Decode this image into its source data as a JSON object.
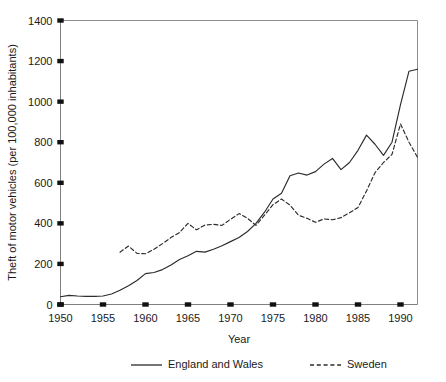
{
  "chart_data": {
    "type": "line",
    "title": "",
    "xlabel": "Year",
    "ylabel": "Theft of motor vehicles (per 100,000 inhabitants)",
    "xlim": [
      1950,
      1992
    ],
    "ylim": [
      0,
      1400
    ],
    "xticks": [
      1950,
      1955,
      1960,
      1965,
      1970,
      1975,
      1980,
      1985,
      1990
    ],
    "yticks": [
      0,
      200,
      400,
      600,
      800,
      1000,
      1200,
      1400
    ],
    "xtick_labels": [
      "1950",
      "1955",
      "1960",
      "1965",
      "1970",
      "1975",
      "1980",
      "1985",
      "1990"
    ],
    "ytick_labels": [
      "0",
      "200",
      "400",
      "600",
      "800",
      "1000",
      "1200",
      "1400"
    ],
    "grid": false,
    "legend_position": "bottom",
    "series": [
      {
        "name": "England and Wales",
        "style": "solid",
        "color": "#2b2b2b",
        "x": [
          1950,
          1951,
          1952,
          1953,
          1954,
          1955,
          1956,
          1957,
          1958,
          1959,
          1960,
          1961,
          1962,
          1963,
          1964,
          1965,
          1966,
          1967,
          1968,
          1969,
          1970,
          1971,
          1972,
          1973,
          1974,
          1975,
          1976,
          1977,
          1978,
          1979,
          1980,
          1981,
          1982,
          1983,
          1984,
          1985,
          1986,
          1987,
          1988,
          1989,
          1990,
          1991,
          1992
        ],
        "values": [
          38,
          45,
          42,
          40,
          40,
          42,
          52,
          70,
          92,
          118,
          152,
          158,
          172,
          195,
          222,
          240,
          262,
          258,
          272,
          290,
          310,
          330,
          360,
          400,
          455,
          520,
          548,
          635,
          648,
          638,
          655,
          692,
          720,
          665,
          700,
          760,
          835,
          790,
          735,
          800,
          985,
          1150,
          1160
        ]
      },
      {
        "name": "Sweden",
        "style": "dashed",
        "color": "#2b2b2b",
        "x": [
          1957,
          1958,
          1959,
          1960,
          1961,
          1962,
          1963,
          1964,
          1965,
          1966,
          1967,
          1968,
          1969,
          1970,
          1971,
          1972,
          1973,
          1974,
          1975,
          1976,
          1977,
          1978,
          1979,
          1980,
          1981,
          1982,
          1983,
          1984,
          1985,
          1986,
          1987,
          1988,
          1989,
          1990,
          1991,
          1992
        ],
        "values": [
          258,
          288,
          252,
          250,
          272,
          300,
          330,
          355,
          400,
          368,
          392,
          395,
          390,
          420,
          448,
          425,
          390,
          440,
          492,
          520,
          490,
          440,
          425,
          405,
          422,
          418,
          428,
          452,
          478,
          560,
          650,
          700,
          740,
          890,
          800,
          725
        ]
      }
    ]
  },
  "legend": {
    "items": [
      {
        "label": "England and Wales",
        "style": "solid"
      },
      {
        "label": "Sweden",
        "style": "dashed"
      }
    ]
  }
}
